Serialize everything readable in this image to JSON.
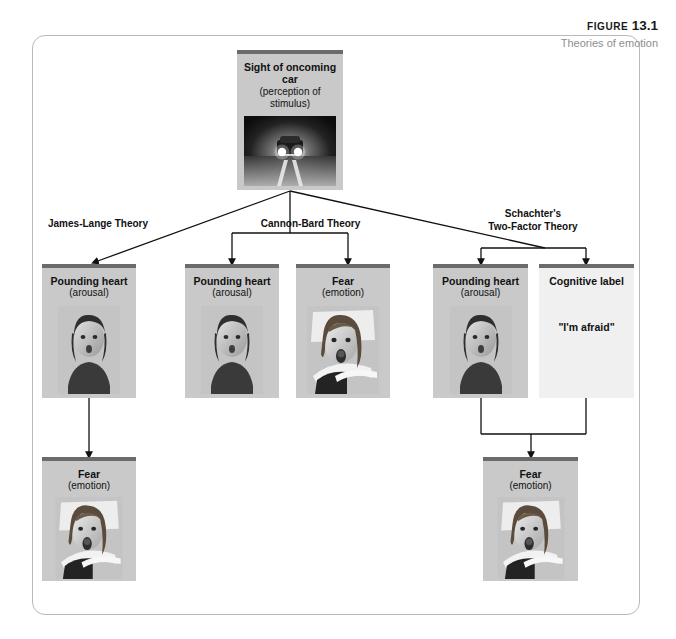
{
  "figure": {
    "label_prefix": "FIGURE",
    "number": "13.1",
    "subtitle": "Theories of emotion"
  },
  "nodes": {
    "stimulus": {
      "title": "Sight of oncoming car",
      "subtitle": "(perception of stimulus)",
      "image": "oncoming-car-photo"
    },
    "jl_arousal": {
      "title": "Pounding heart",
      "subtitle": "(arousal)",
      "image": "pounding-heart-face-photo"
    },
    "jl_emotion": {
      "title": "Fear",
      "subtitle": "(emotion)",
      "image": "fearful-face-driving-photo"
    },
    "cb_arousal": {
      "title": "Pounding heart",
      "subtitle": "(arousal)",
      "image": "pounding-heart-face-photo"
    },
    "cb_emotion": {
      "title": "Fear",
      "subtitle": "(emotion)",
      "image": "fearful-face-driving-photo"
    },
    "sc_arousal": {
      "title": "Pounding heart",
      "subtitle": "(arousal)",
      "image": "pounding-heart-face-photo"
    },
    "sc_label": {
      "title": "Cognitive label",
      "subtitle": "",
      "quote": "\"I'm afraid\"",
      "image": ""
    },
    "sc_emotion": {
      "title": "Fear",
      "subtitle": "(emotion)",
      "image": "fearful-face-driving-photo"
    }
  },
  "theories": {
    "james_lange": "James-Lange Theory",
    "cannon_bard": "Cannon-Bard Theory",
    "schachter_line1": "Schachter's",
    "schachter_line2": "Two-Factor Theory"
  },
  "colors": {
    "box_fill": "#c9c9c9",
    "box_fill_light": "#f0f0f0",
    "box_topbar": "#6b6b6b",
    "frame_border": "#b9b9b9",
    "text": "#111111",
    "caption_sub": "#8e8e8e",
    "connector": "#111111"
  }
}
